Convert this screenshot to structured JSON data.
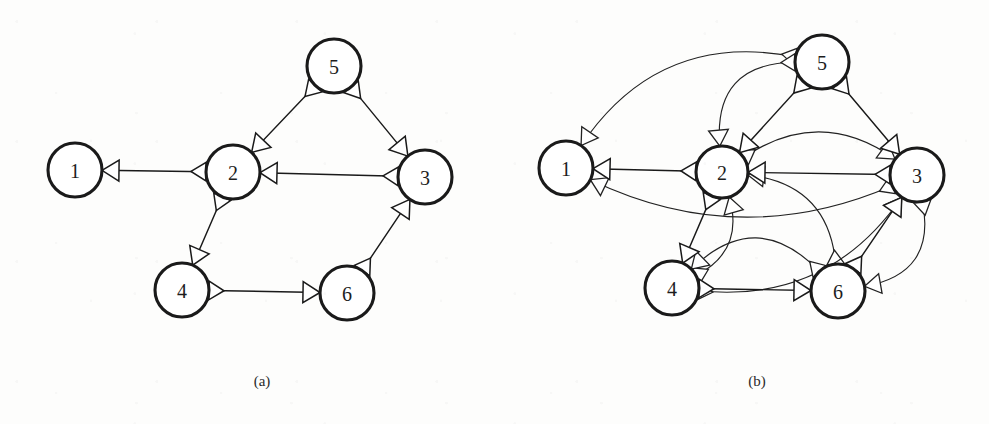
{
  "figure": {
    "width": 989,
    "height": 424,
    "background_color": "#fdfdfc",
    "node_stroke_color": "#1a1a1a",
    "node_fill_color": "#ffffff",
    "edge_color": "#1a1a1a",
    "label_color": "#1d1d1d"
  },
  "panels": [
    {
      "id": "panel-a",
      "caption": "(a)",
      "caption_x": 262,
      "caption_y": 381,
      "kind": "original-digraph",
      "nodes": [
        {
          "id": "1",
          "label": "1",
          "cx": 75,
          "cy": 170,
          "r": 27
        },
        {
          "id": "2",
          "label": "2",
          "cx": 233,
          "cy": 172,
          "r": 27
        },
        {
          "id": "3",
          "label": "3",
          "cx": 425,
          "cy": 177,
          "r": 27
        },
        {
          "id": "4",
          "label": "4",
          "cx": 182,
          "cy": 290,
          "r": 27
        },
        {
          "id": "5",
          "label": "5",
          "cx": 334,
          "cy": 66,
          "r": 27
        },
        {
          "id": "6",
          "label": "6",
          "cx": 347,
          "cy": 293,
          "r": 27
        }
      ],
      "edges": [
        {
          "from": "2",
          "to": "1",
          "style": "straight",
          "curve": 0
        },
        {
          "from": "5",
          "to": "2",
          "style": "straight",
          "curve": 0
        },
        {
          "from": "5",
          "to": "3",
          "style": "straight",
          "curve": 0
        },
        {
          "from": "3",
          "to": "2",
          "style": "straight",
          "curve": 0
        },
        {
          "from": "2",
          "to": "4",
          "style": "straight",
          "curve": 0
        },
        {
          "from": "4",
          "to": "6",
          "style": "straight",
          "curve": 0
        },
        {
          "from": "6",
          "to": "3",
          "style": "straight",
          "curve": 0
        }
      ]
    },
    {
      "id": "panel-b",
      "caption": "(b)",
      "caption_x": 757,
      "caption_y": 381,
      "kind": "transitive-closure",
      "nodes": [
        {
          "id": "1",
          "label": "1",
          "cx": 566,
          "cy": 168,
          "r": 27
        },
        {
          "id": "2",
          "label": "2",
          "cx": 722,
          "cy": 172,
          "r": 26
        },
        {
          "id": "3",
          "label": "3",
          "cx": 917,
          "cy": 175,
          "r": 27
        },
        {
          "id": "4",
          "label": "4",
          "cx": 672,
          "cy": 288,
          "r": 27
        },
        {
          "id": "5",
          "label": "5",
          "cx": 822,
          "cy": 62,
          "r": 27
        },
        {
          "id": "6",
          "label": "6",
          "cx": 838,
          "cy": 291,
          "r": 27
        }
      ],
      "edges": [
        {
          "from": "2",
          "to": "1",
          "style": "straight",
          "curve": 0
        },
        {
          "from": "5",
          "to": "2",
          "style": "straight",
          "curve": 0
        },
        {
          "from": "5",
          "to": "3",
          "style": "straight",
          "curve": 0
        },
        {
          "from": "3",
          "to": "2",
          "style": "straight",
          "curve": 0
        },
        {
          "from": "2",
          "to": "4",
          "style": "straight",
          "curve": 0
        },
        {
          "from": "4",
          "to": "6",
          "style": "straight",
          "curve": 0
        },
        {
          "from": "6",
          "to": "3",
          "style": "straight",
          "curve": 0
        },
        {
          "from": "5",
          "to": "1",
          "style": "curved",
          "curve": 46
        },
        {
          "from": "3",
          "to": "1",
          "style": "curved",
          "curve": -40
        },
        {
          "from": "4",
          "to": "1",
          "style": "curved",
          "curve": 0,
          "skip": true
        },
        {
          "from": "5",
          "to": "2",
          "style": "curved",
          "curve": 40,
          "variant": "outer"
        },
        {
          "from": "4",
          "to": "2",
          "style": "curved",
          "curve": 26
        },
        {
          "from": "6",
          "to": "2",
          "style": "curved",
          "curve": 34
        },
        {
          "from": "2",
          "to": "3",
          "style": "curved",
          "curve": -34
        },
        {
          "from": "2",
          "to": "6",
          "style": "curved",
          "curve": 0,
          "skip": true
        },
        {
          "from": "4",
          "to": "3",
          "style": "curved",
          "curve": 40
        },
        {
          "from": "3",
          "to": "6",
          "style": "curved",
          "curve": -36
        },
        {
          "from": "6",
          "to": "4",
          "style": "curved",
          "curve": 42
        }
      ]
    }
  ]
}
